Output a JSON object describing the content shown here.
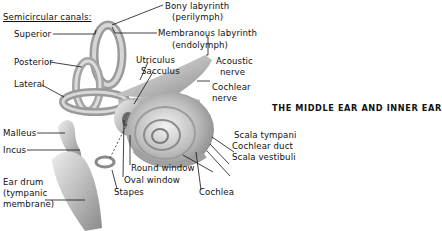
{
  "title": "THE MIDDLE EAR AND INNER EAR",
  "labels": {
    "semicircular_canals": "Semicircular canals:",
    "superior": "Superior",
    "posterior": "Posterior",
    "lateral": "Lateral",
    "bony_labyrinth": "Bony labyrinth",
    "perilymph": "(perilymph)",
    "membranous_labyrinth": "Membranous labyrinth",
    "endolymph": "(endolymph)",
    "utriculus": "Utriculus",
    "sacculus": "Sacculus",
    "acoustic": "Acoustic",
    "nerve1": "nerve",
    "cochlear": "Cochlear",
    "nerve2": "nerve",
    "malleus": "Malleus",
    "incus": "Incus",
    "ear_drum": "Ear drum",
    "tympanic": "(tympanic",
    "membrane": "membrane)",
    "round_window": "Round window",
    "oval_window": "Oval window",
    "stapes": "Stapes",
    "cochlea": "Cochlea",
    "scala_tympani": "Scala tympani",
    "cochlear_duct": "Cochlear duct",
    "scala_vestibuli": "Scala vestibuli"
  },
  "colors": {
    "structure_fill": "#c8c8c8",
    "structure_shade": "#8c8c8c",
    "structure_light": "#ececec",
    "leader": "#111111"
  }
}
